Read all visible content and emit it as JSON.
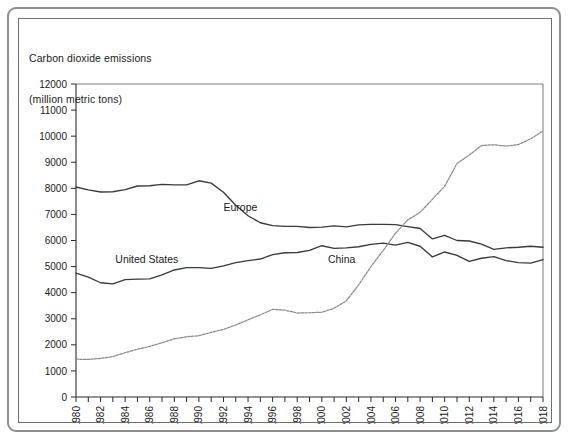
{
  "title": {
    "line1": "Carbon dioxide emissions",
    "line2": "(million metric tons)"
  },
  "colors": {
    "frame_outer": "#8e8e8e",
    "frame_inner": "#6e6e6e",
    "axis": "#2a2a2a",
    "plot_border": "#6b6b6b",
    "united_states": "#3a3a3a",
    "europe": "#3a3a3a",
    "china": "#8a8a8a",
    "background": "#ffffff"
  },
  "chart_data": {
    "type": "line",
    "title": "Carbon dioxide emissions (million metric tons)",
    "xlabel": "",
    "ylabel": "million metric tons",
    "xlim": [
      1980,
      2018
    ],
    "ylim": [
      0,
      12000
    ],
    "grid": false,
    "legend": "inline-annotations",
    "yticks": [
      0,
      1000,
      2000,
      3000,
      4000,
      5000,
      6000,
      7000,
      8000,
      9000,
      10000,
      11000,
      12000
    ],
    "ytick_labels": [
      "0",
      "1000",
      "2000",
      "3000",
      "4000",
      "5000",
      "6000",
      "7000",
      "8000",
      "9000",
      "10000",
      "11000",
      "12000"
    ],
    "xticks": [
      1980,
      1981,
      1982,
      1983,
      1984,
      1985,
      1986,
      1987,
      1988,
      1989,
      1990,
      1991,
      1992,
      1993,
      1994,
      1995,
      1996,
      1997,
      1998,
      1999,
      2000,
      2001,
      2002,
      2003,
      2004,
      2005,
      2006,
      2007,
      2008,
      2009,
      2010,
      2011,
      2012,
      2013,
      2014,
      2015,
      2016,
      2017,
      2018
    ],
    "xtick_labels": [
      "1980",
      "",
      "1982",
      "",
      "1984",
      "",
      "1986",
      "",
      "1988",
      "",
      "1990",
      "",
      "1992",
      "",
      "1994",
      "",
      "1996",
      "",
      "1998",
      "",
      "2000",
      "",
      "2002",
      "",
      "2004",
      "",
      "2006",
      "",
      "2008",
      "",
      "2010",
      "",
      "2012",
      "",
      "2014",
      "",
      "2016",
      "",
      "2018"
    ],
    "x": [
      1980,
      1981,
      1982,
      1983,
      1984,
      1985,
      1986,
      1987,
      1988,
      1989,
      1990,
      1991,
      1992,
      1993,
      1994,
      1995,
      1996,
      1997,
      1998,
      1999,
      2000,
      2001,
      2002,
      2003,
      2004,
      2005,
      2006,
      2007,
      2008,
      2009,
      2010,
      2011,
      2012,
      2013,
      2014,
      2015,
      2016,
      2017,
      2018
    ],
    "series": [
      {
        "name": "Europe",
        "label": "Europe",
        "color": "#3a3a3a",
        "style": "solid",
        "label_x": 1992.0,
        "label_y": 7120,
        "values": [
          8050,
          7940,
          7860,
          7870,
          7950,
          8090,
          8100,
          8150,
          8130,
          8130,
          8290,
          8200,
          7850,
          7350,
          6950,
          6680,
          6570,
          6540,
          6540,
          6500,
          6510,
          6560,
          6520,
          6600,
          6620,
          6620,
          6610,
          6530,
          6460,
          6060,
          6200,
          6000,
          5980,
          5860,
          5660,
          5720,
          5740,
          5780,
          5740
        ]
      },
      {
        "name": "United States",
        "label": "United States",
        "color": "#3a3a3a",
        "style": "solid",
        "label_x": 1983.2,
        "label_y": 5120,
        "values": [
          4750,
          4600,
          4380,
          4340,
          4500,
          4520,
          4530,
          4680,
          4870,
          4960,
          4960,
          4930,
          5030,
          5150,
          5230,
          5290,
          5460,
          5530,
          5540,
          5620,
          5800,
          5700,
          5720,
          5760,
          5850,
          5900,
          5820,
          5930,
          5780,
          5370,
          5560,
          5430,
          5200,
          5320,
          5380,
          5230,
          5150,
          5130,
          5270
        ]
      },
      {
        "name": "China",
        "label": "China",
        "color": "#8a8a8a",
        "style": "dotted",
        "label_x": 2000.5,
        "label_y": 5120,
        "values": [
          1450,
          1440,
          1480,
          1550,
          1700,
          1830,
          1940,
          2080,
          2230,
          2310,
          2350,
          2480,
          2590,
          2760,
          2960,
          3150,
          3360,
          3330,
          3220,
          3230,
          3250,
          3400,
          3690,
          4300,
          5000,
          5620,
          6280,
          6790,
          7080,
          7580,
          8080,
          8950,
          9280,
          9640,
          9670,
          9620,
          9680,
          9900,
          10200
        ]
      }
    ]
  }
}
